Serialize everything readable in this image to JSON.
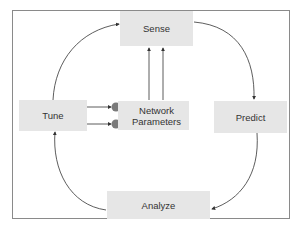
{
  "diagram": {
    "type": "cycle",
    "nodes": {
      "sense": "Sense",
      "predict": "Predict",
      "analyze": "Analyze",
      "tune": "Tune",
      "network_parameters_line1": "Network",
      "network_parameters_line2": "Parameters"
    },
    "edges": [
      {
        "from": "Sense",
        "to": "Predict"
      },
      {
        "from": "Predict",
        "to": "Analyze"
      },
      {
        "from": "Analyze",
        "to": "Tune"
      },
      {
        "from": "Tune",
        "to": "Sense"
      },
      {
        "from": "Tune",
        "to": "Network Parameters"
      },
      {
        "from": "Tune",
        "to": "Network Parameters"
      },
      {
        "from": "Network Parameters",
        "to": "Sense"
      },
      {
        "from": "Network Parameters",
        "to": "Sense"
      }
    ],
    "colors": {
      "box_fill": "#e6e6e6",
      "frame": "#8a8a8a",
      "arrow": "#333333",
      "knob": "#7a7a7a"
    }
  }
}
